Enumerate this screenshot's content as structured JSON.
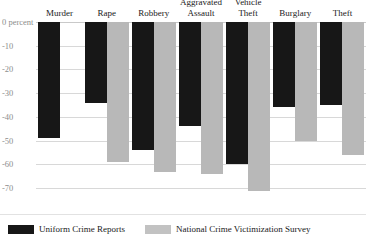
{
  "chart_data": {
    "type": "bar",
    "title": "",
    "subtitle": "",
    "xlabel": "",
    "ylabel": "",
    "axis_unit_label": "0 percent",
    "categories": [
      "Murder",
      "Rape",
      "Robbery",
      "Aggravated\nAssault",
      "Vehicle\nTheft",
      "Burglary",
      "Theft"
    ],
    "series": [
      {
        "name": "Uniform Crime Reports",
        "color": "#171717",
        "values": [
          -49,
          -34,
          -54,
          -44,
          -60,
          -36,
          -35
        ]
      },
      {
        "name": "National Crime Victimization Survey",
        "color": "#b8b8b8",
        "values": [
          null,
          -59,
          -63,
          -64,
          -71,
          -50,
          -56
        ]
      }
    ],
    "ylim": [
      -75,
      0
    ],
    "yticks": [
      0,
      -10,
      -20,
      -30,
      -40,
      -50,
      -60,
      -70
    ],
    "ytick_labels": [
      "0 percent",
      "-10",
      "-20",
      "-30",
      "-40",
      "-50",
      "-60",
      "-70"
    ],
    "grid": true,
    "legend_position": "bottom-left",
    "orientation": "vertical"
  },
  "legend": {
    "items": [
      {
        "label": "Uniform Crime Reports",
        "swatch": "ucr"
      },
      {
        "label": "National Crime Victimization Survey",
        "swatch": "ncvs"
      }
    ]
  },
  "colors": {
    "ucr": "#171717",
    "ncvs": "#b8b8b8",
    "grid": "#d8d8d8",
    "axis_text": "#8d8d8d",
    "label_text": "#1a1a1a",
    "background": "#ffffff"
  }
}
